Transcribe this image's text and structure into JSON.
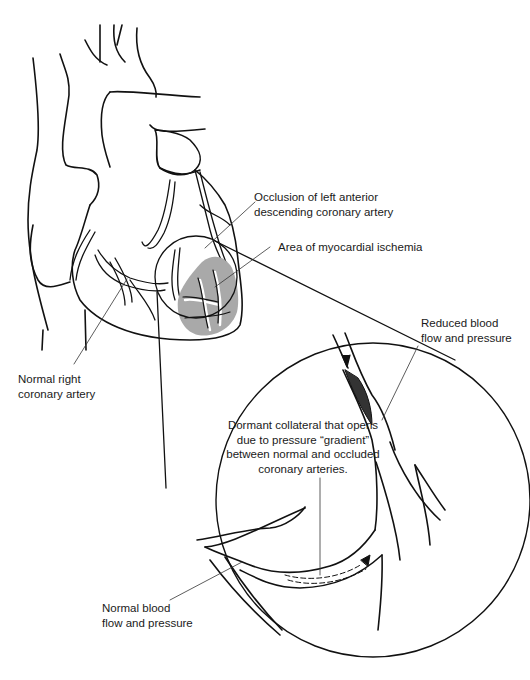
{
  "figure": {
    "colors": {
      "line": "#111111",
      "ischemia_fill": "#a9a9a9",
      "leader_line": "#333333",
      "background": "#ffffff"
    }
  },
  "labels": {
    "occlusion": {
      "line1": "Occlusion of left anterior",
      "line2": "descending coronary artery"
    },
    "ischemia": {
      "line1": "Area of myocardial ischemia"
    },
    "right_coronary": {
      "line1": "Normal right",
      "line2": "coronary artery"
    },
    "reduced_flow": {
      "line1": "Reduced blood",
      "line2": "flow and pressure"
    },
    "collateral": {
      "line1": "Dormant collateral that opens",
      "line2": "due to pressure “gradient”",
      "line3": "between normal and occluded",
      "line4": "coronary arteries."
    },
    "normal_flow": {
      "line1": "Normal blood",
      "line2": "flow and pressure"
    }
  }
}
